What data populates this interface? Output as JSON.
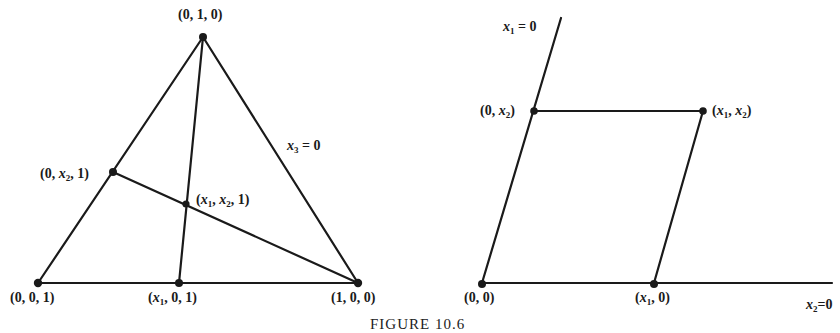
{
  "figure": {
    "caption": "FIGURE 10.6",
    "stroke_color": "#1a1a1a",
    "background": "#ffffff"
  },
  "triangle": {
    "vertices": {
      "top": {
        "label": "(0, 1, 0)",
        "x": 203,
        "y": 37
      },
      "bottom_left": {
        "label": "(0, 0, 1)",
        "x": 38,
        "y": 283
      },
      "bottom_right": {
        "label": "(1, 0, 0)",
        "x": 358,
        "y": 283
      }
    },
    "points": {
      "on_base": {
        "label_parts": [
          "(",
          "x",
          "1",
          ", 0, 1)"
        ],
        "x": 179,
        "y": 283
      },
      "on_left_edge": {
        "label_parts": [
          "(0, ",
          "x",
          "2",
          ", 1)"
        ],
        "x": 113,
        "y": 172
      },
      "intersection": {
        "label_parts": [
          "(",
          "x",
          "1",
          ", ",
          "x",
          "2",
          ", 1)"
        ],
        "x": 186,
        "y": 204
      }
    },
    "edge_label": {
      "var": "x",
      "sub": "3",
      "rest": " = 0"
    }
  },
  "plane": {
    "points": {
      "origin": {
        "label": "(0, 0)",
        "x": 482,
        "y": 283
      },
      "x1_axis_point": {
        "label_parts": [
          "(",
          "x",
          "1",
          ", 0)"
        ],
        "x": 654,
        "y": 283
      },
      "x2_axis_point": {
        "label_parts": [
          "(0, ",
          "x",
          "2",
          ")"
        ],
        "x": 534,
        "y": 111
      },
      "corner": {
        "label_parts": [
          "(",
          "x",
          "1",
          ", ",
          "x",
          "2",
          ")"
        ],
        "x": 703,
        "y": 111
      }
    },
    "axis_labels": {
      "vertical": {
        "var": "x",
        "sub": "1",
        "rest": " = 0"
      },
      "horizontal": {
        "var": "x",
        "sub": "2",
        "rest": "=0"
      }
    }
  }
}
